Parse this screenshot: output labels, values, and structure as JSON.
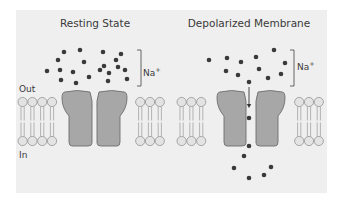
{
  "figure": {
    "background": "#efefef",
    "panel": {
      "x": 16,
      "y": 10,
      "width": 311,
      "height": 183
    },
    "colors": {
      "panel_bg": "#efefef",
      "protein_fill": "#a7a7a7",
      "protein_stroke": "#6e6e6e",
      "lipid_head_fill": "#e3e3e3",
      "lipid_head_stroke": "#8a8a8a",
      "lipid_tail": "#9a9a9a",
      "ion": "#3a3a3a",
      "text": "#3a3a3a"
    }
  },
  "labels": {
    "out": "Out",
    "in": "In"
  },
  "panels": [
    {
      "id": "resting",
      "title": "Resting State",
      "title_x": 95,
      "ion_label": "Na",
      "ion_charge": "+",
      "bracket": {
        "x": 137,
        "y1": 50,
        "y2": 86
      },
      "ion_label_pos": {
        "x": 143,
        "y": 76
      },
      "membrane": {
        "x1": 18,
        "x2": 169
      },
      "channel": {
        "left_x": 62,
        "right_x": 97,
        "width": 30,
        "top": 90,
        "bottom": 146
      },
      "open": false,
      "ions": [
        [
          64,
          52
        ],
        [
          80,
          50
        ],
        [
          103,
          52
        ],
        [
          121,
          54
        ],
        [
          58,
          60
        ],
        [
          84,
          62
        ],
        [
          104,
          66
        ],
        [
          116,
          60
        ],
        [
          47,
          71
        ],
        [
          60,
          70
        ],
        [
          73,
          72
        ],
        [
          100,
          70
        ],
        [
          109,
          73
        ],
        [
          118,
          67
        ],
        [
          61,
          80
        ],
        [
          76,
          83
        ],
        [
          89,
          77
        ],
        [
          108,
          81
        ],
        [
          127,
          79
        ],
        [
          125,
          70
        ]
      ]
    },
    {
      "id": "depolarized",
      "title": "Depolarized Membrane",
      "title_x": 249,
      "ion_label": "Na",
      "ion_charge": "+",
      "bracket": {
        "x": 290,
        "y1": 50,
        "y2": 86
      },
      "ion_label_pos": {
        "x": 297,
        "y": 70
      },
      "membrane": {
        "x1": 177,
        "x2": 327
      },
      "channel": {
        "left_x": 217,
        "right_x": 256,
        "width": 29,
        "top": 90,
        "bottom": 146
      },
      "open": true,
      "arrow": {
        "x": 249,
        "y1": 82,
        "y2": 108
      },
      "ions": [
        [
          209,
          60
        ],
        [
          227,
          58
        ],
        [
          241,
          62
        ],
        [
          256,
          57
        ],
        [
          274,
          50
        ],
        [
          285,
          63
        ],
        [
          226,
          71
        ],
        [
          238,
          75
        ],
        [
          259,
          69
        ],
        [
          268,
          78
        ],
        [
          281,
          74
        ],
        [
          249,
          82
        ],
        [
          249,
          118
        ],
        [
          249,
          146
        ],
        [
          244,
          156
        ],
        [
          234,
          168
        ],
        [
          271,
          167
        ],
        [
          249,
          178
        ],
        [
          264,
          175
        ]
      ]
    }
  ]
}
